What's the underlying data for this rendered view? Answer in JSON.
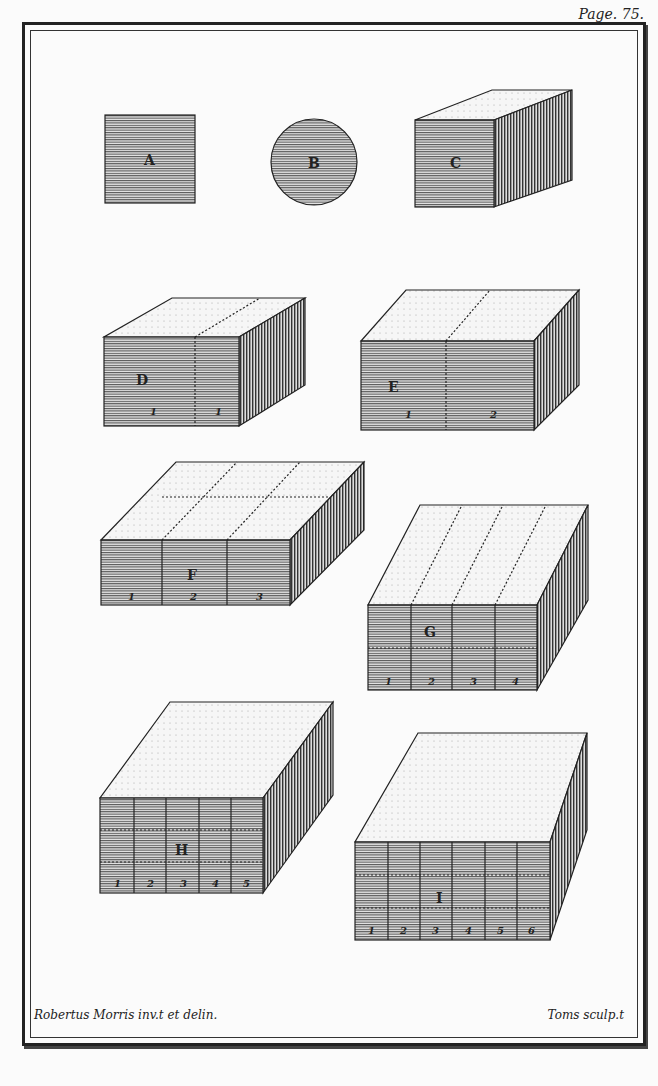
{
  "page_label": "Page. 75.",
  "credits": {
    "left": "Robertus Morris inv.t et delin.",
    "right": "Toms sculp.t"
  },
  "figures": [
    {
      "id": "A",
      "shape": "square"
    },
    {
      "id": "B",
      "shape": "circle"
    },
    {
      "id": "C",
      "shape": "cube",
      "top_labels": [
        "1"
      ],
      "side_labels": [
        "1"
      ],
      "front_labels": [
        "1"
      ]
    },
    {
      "id": "D",
      "shape": "block",
      "front_cols": [
        "1",
        "1"
      ],
      "top_labels": [
        "1"
      ]
    },
    {
      "id": "E",
      "shape": "block",
      "front_cols": [
        "1",
        "2"
      ],
      "top_labels": [
        "1"
      ]
    },
    {
      "id": "F",
      "shape": "block",
      "front_cols": [
        "1",
        "2",
        "3"
      ],
      "top_labels": [
        "1",
        "2"
      ]
    },
    {
      "id": "G",
      "shape": "block",
      "front_cols": [
        "1",
        "2",
        "3",
        "4"
      ],
      "top_labels": [
        "1",
        "2",
        "3"
      ]
    },
    {
      "id": "H",
      "shape": "block",
      "front_cols": [
        "1",
        "2",
        "3",
        "4",
        "5"
      ],
      "top_labels": [
        "1",
        "2",
        "3",
        "4"
      ]
    },
    {
      "id": "I",
      "shape": "block",
      "front_cols": [
        "1",
        "2",
        "3",
        "4",
        "5",
        "6"
      ],
      "top_labels": [
        "1",
        "2",
        "3",
        "4"
      ]
    }
  ]
}
